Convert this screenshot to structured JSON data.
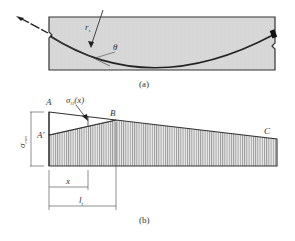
{
  "figure_a": {
    "caption": "(a)",
    "labels": {
      "radius": "r",
      "radius_sub": "s",
      "angle": "θ"
    }
  },
  "figure_b": {
    "caption": "(b)",
    "points": {
      "A": "A",
      "A_prime": "A′",
      "B": "B",
      "C": "C"
    },
    "stress_label": "σ",
    "stress_sub": "l1",
    "stress_fn_suffix": "(x)",
    "sigma_con": "σ",
    "sigma_con_sub": "con",
    "dim_x": "x",
    "dim_lf": "l",
    "dim_lf_sub": "f"
  },
  "colors": {
    "fill": "#d9d9d9",
    "stroke": "#333333",
    "hatch": "#7a7a7a"
  }
}
